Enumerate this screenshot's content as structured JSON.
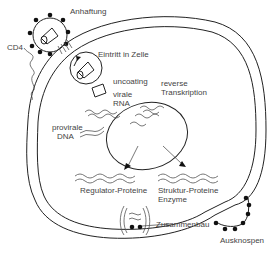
{
  "diagram": {
    "colors": {
      "line": "#222222",
      "text": "#444444",
      "background": "#ffffff"
    },
    "labels": {
      "attachment": "Anhaftung",
      "cd4": "CD4",
      "entry": "Eintritt in Zelle",
      "uncoating": "uncoating",
      "viral_rna_1": "virale",
      "viral_rna_2": "RNA",
      "reverse_1": "reverse",
      "reverse_2": "Transkription",
      "proviral_1": "provirale",
      "proviral_2": "DNA",
      "regulator": "Regulator-Proteine",
      "struktur": "Struktur-Proteine",
      "enzyme": "Enzyme",
      "assembly": "Zusammenbau",
      "budding": "Ausknospen"
    },
    "elements": [
      "cell-membrane-double",
      "nucleus",
      "virion-attaching",
      "cd4-receptor",
      "endosome-vesicle",
      "capsid-uncoated",
      "viral-rna-strands",
      "proviral-dna-strands",
      "mrna-regulator",
      "mrna-structural",
      "assembly-site",
      "budding-virion"
    ]
  }
}
